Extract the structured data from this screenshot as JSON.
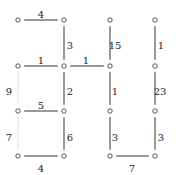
{
  "diagram": {
    "type": "weighted-grid-graph",
    "nodes": [
      {
        "id": "n00",
        "x": 18,
        "y": 20
      },
      {
        "id": "n01",
        "x": 64,
        "y": 20
      },
      {
        "id": "n02",
        "x": 110,
        "y": 20
      },
      {
        "id": "n03",
        "x": 155,
        "y": 20
      },
      {
        "id": "n10",
        "x": 18,
        "y": 66
      },
      {
        "id": "n11",
        "x": 64,
        "y": 66
      },
      {
        "id": "n12",
        "x": 110,
        "y": 66
      },
      {
        "id": "n13",
        "x": 155,
        "y": 66
      },
      {
        "id": "n20",
        "x": 18,
        "y": 111
      },
      {
        "id": "n21",
        "x": 64,
        "y": 111
      },
      {
        "id": "n22",
        "x": 110,
        "y": 111
      },
      {
        "id": "n23",
        "x": 155,
        "y": 111
      },
      {
        "id": "n30",
        "x": 18,
        "y": 156
      },
      {
        "id": "n31",
        "x": 64,
        "y": 156
      },
      {
        "id": "n32",
        "x": 110,
        "y": 156
      },
      {
        "id": "n33",
        "x": 155,
        "y": 156
      }
    ],
    "edges": [
      {
        "from": "n00",
        "to": "n01",
        "weight": "4",
        "style": "solid",
        "lx": 41,
        "ly": 15
      },
      {
        "from": "n01",
        "to": "n11",
        "weight": "3",
        "style": "solid",
        "lx": 70,
        "ly": 46
      },
      {
        "from": "n02",
        "to": "n12",
        "weight": "15",
        "style": "solid",
        "lx": 115,
        "ly": 46
      },
      {
        "from": "n03",
        "to": "n13",
        "weight": "1",
        "style": "solid",
        "lx": 161,
        "ly": 46
      },
      {
        "from": "n10",
        "to": "n11",
        "weight": "1",
        "style": "solid",
        "lx": 41,
        "ly": 61
      },
      {
        "from": "n11",
        "to": "n12",
        "weight": "1",
        "style": "solid",
        "lx": 86,
        "ly": 61
      },
      {
        "from": "n10",
        "to": "n20",
        "weight": "9",
        "style": "dotted",
        "lx": 9,
        "ly": 92
      },
      {
        "from": "n11",
        "to": "n21",
        "weight": "2",
        "style": "solid",
        "lx": 70,
        "ly": 92
      },
      {
        "from": "n12",
        "to": "n22",
        "weight": "1",
        "style": "solid",
        "lx": 115,
        "ly": 92
      },
      {
        "from": "n13",
        "to": "n23",
        "weight": "23",
        "style": "solid",
        "lx": 160,
        "ly": 92
      },
      {
        "from": "n20",
        "to": "n21",
        "weight": "5",
        "style": "solid",
        "lx": 41,
        "ly": 106
      },
      {
        "from": "n20",
        "to": "n30",
        "weight": "7",
        "style": "dotted",
        "lx": 9,
        "ly": 138
      },
      {
        "from": "n21",
        "to": "n31",
        "weight": "6",
        "style": "solid",
        "lx": 70,
        "ly": 138
      },
      {
        "from": "n22",
        "to": "n32",
        "weight": "3",
        "style": "solid",
        "lx": 115,
        "ly": 138
      },
      {
        "from": "n23",
        "to": "n33",
        "weight": "3",
        "style": "solid",
        "lx": 161,
        "ly": 138
      },
      {
        "from": "n30",
        "to": "n31",
        "weight": "4",
        "style": "solid",
        "lx": 41,
        "ly": 169
      },
      {
        "from": "n32",
        "to": "n33",
        "weight": "7",
        "style": "solid",
        "lx": 132,
        "ly": 169
      }
    ],
    "colors": {
      "edge": "#333333",
      "dotted_edge": "#aaaaaa",
      "node_stroke": "#444444",
      "label": "#222222"
    }
  }
}
